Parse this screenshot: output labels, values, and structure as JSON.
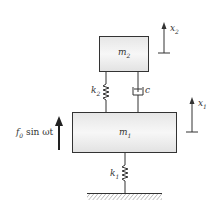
{
  "diagram": {
    "type": "two-degree-of-freedom mass-spring-damper system",
    "masses": {
      "upper": {
        "label": "m",
        "sub": "2"
      },
      "lower": {
        "label": "m",
        "sub": "1"
      }
    },
    "springs": {
      "upper": {
        "label": "k",
        "sub": "2"
      },
      "lower": {
        "label": "k",
        "sub": "1"
      }
    },
    "damper": {
      "label": "c"
    },
    "displacements": {
      "upper": {
        "label": "x",
        "sub": "2"
      },
      "lower": {
        "label": "x",
        "sub": "1"
      }
    },
    "force": {
      "label_pre": "f",
      "sub": "0",
      "label_post": " sin ωt"
    },
    "colors": {
      "stroke": "#333333",
      "mass_fill_top": "#e8e8e8",
      "mass_fill_bottom": "#f8f8f8"
    }
  }
}
